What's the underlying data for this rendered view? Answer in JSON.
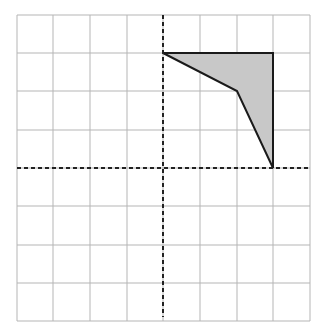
{
  "diagram": {
    "type": "coordinate-grid",
    "grid": {
      "columns": 8,
      "rows": 8,
      "x_lines_px": [
        17,
        53,
        90,
        127,
        163,
        200,
        237,
        273,
        310
      ],
      "y_lines_px": [
        15,
        53,
        91,
        130,
        168,
        206,
        245,
        283,
        321
      ],
      "line_color": "#b5b5b5"
    },
    "axes": {
      "x_axis_y_px": 168,
      "y_axis_x_px": 163,
      "style": "dashed",
      "color": "#222222"
    },
    "shape": {
      "name": "shaded-quadrilateral",
      "vertices_grid": [
        [
          0,
          3
        ],
        [
          3,
          3
        ],
        [
          3,
          0
        ],
        [
          2,
          2
        ]
      ],
      "vertices_px": [
        [
          163,
          53
        ],
        [
          273,
          53
        ],
        [
          273,
          168
        ],
        [
          237,
          91
        ]
      ],
      "fill": "#c8c8c8",
      "stroke": "#1a1a1a"
    }
  }
}
